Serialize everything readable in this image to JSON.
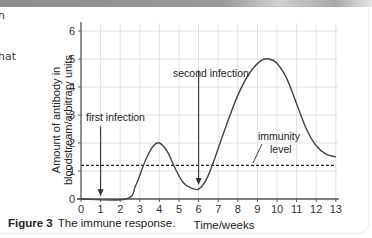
{
  "side_text_fragments": [
    "n",
    "hat"
  ],
  "caption": {
    "label": "Figure 3",
    "text": "The immune response."
  },
  "chart_data": {
    "type": "line",
    "title": "The immune response",
    "xlabel": "Time/weeks",
    "ylabel_line1": "Amount of antibody in",
    "ylabel_line2": "bloodstream/arbitrary units",
    "xlim": [
      0,
      13
    ],
    "ylim": [
      0,
      6
    ],
    "xticks": [
      0,
      1,
      2,
      3,
      4,
      5,
      6,
      7,
      8,
      9,
      10,
      11,
      12,
      13
    ],
    "yticks": [
      0,
      1,
      2,
      3,
      4,
      5,
      6
    ],
    "grid": true,
    "series": [
      {
        "name": "antibody level",
        "x": [
          0,
          2.3,
          2.8,
          3.3,
          3.7,
          4.0,
          4.4,
          4.8,
          5.2,
          5.6,
          6.0,
          6.4,
          6.8,
          7.4,
          8.0,
          8.6,
          9.2,
          9.6,
          10.0,
          10.5,
          11.0,
          11.5,
          12.0,
          12.5,
          13.0
        ],
        "values": [
          0,
          0,
          0.5,
          1.4,
          1.9,
          2.0,
          1.7,
          1.1,
          0.6,
          0.4,
          0.35,
          0.7,
          1.4,
          2.6,
          3.7,
          4.5,
          4.95,
          5.0,
          4.85,
          4.3,
          3.4,
          2.5,
          1.9,
          1.6,
          1.5
        ]
      },
      {
        "name": "immunity level",
        "style": "dashed",
        "x": [
          0,
          13
        ],
        "values": [
          1.2,
          1.2
        ]
      }
    ],
    "annotations": [
      {
        "text": "first infection",
        "arrow_x": 1,
        "arrow_from_y": 2.6,
        "arrow_to_y": 0.1
      },
      {
        "text": "second infection",
        "arrow_x": 6,
        "arrow_from_y": 4.6,
        "arrow_to_y": 0.5
      },
      {
        "text_line1": "immunity",
        "text_line2": "level",
        "pointer_to": [
          10.4,
          1.25
        ]
      }
    ]
  }
}
